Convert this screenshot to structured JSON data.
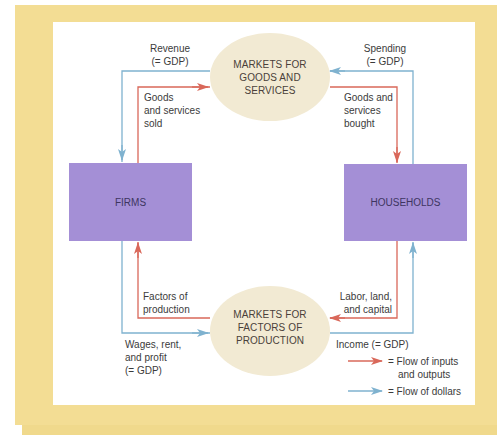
{
  "colors": {
    "frame": "#f3dd94",
    "panel": "#ffffff",
    "sector_box": "#a48fd6",
    "market_ellipse": "#f2ead3",
    "flow_inputs_outputs": "#d9685a",
    "flow_dollars": "#7fb2cf"
  },
  "markets": {
    "goods_services": "MARKETS FOR GOODS AND SERVICES",
    "goods_services_lines": [
      "MARKETS FOR",
      "GOODS AND",
      "SERVICES"
    ],
    "factors": "MARKETS FOR FACTORS OF PRODUCTION",
    "factors_lines": [
      "MARKETS FOR",
      "FACTORS OF",
      "PRODUCTION"
    ]
  },
  "sectors": {
    "firms": "FIRMS",
    "households": "HOUSEHOLDS"
  },
  "flow_labels": {
    "revenue": [
      "Revenue",
      "(= GDP)"
    ],
    "spending": [
      "Spending",
      "(= GDP)"
    ],
    "goods_sold": [
      "Goods",
      "and services",
      "sold"
    ],
    "goods_bought": [
      "Goods and",
      "services",
      "bought"
    ],
    "factors_of_production": [
      "Factors of",
      "production"
    ],
    "labor_land_capital": [
      "Labor, land,",
      "and capital"
    ],
    "wages": [
      "Wages, rent,",
      "and profit",
      "(= GDP)"
    ],
    "income": "Income (= GDP)"
  },
  "legend": {
    "inputs_outputs": [
      "= Flow of inputs",
      "and outputs"
    ],
    "dollars": "= Flow of dollars"
  }
}
